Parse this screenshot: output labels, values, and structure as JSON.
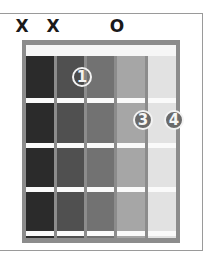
{
  "chord_diagram": {
    "string_markers": [
      {
        "string": 1,
        "label": "X",
        "x": 22
      },
      {
        "string": 2,
        "label": "X",
        "x": 53
      },
      {
        "string": 4,
        "label": "O",
        "x": 117
      }
    ],
    "columns": [
      {
        "x": 26,
        "w": 28,
        "color": "#2b2b2b"
      },
      {
        "x": 57,
        "w": 27,
        "color": "#505050"
      },
      {
        "x": 87,
        "w": 27,
        "color": "#727272"
      },
      {
        "x": 117,
        "w": 28,
        "color": "#a6a6a6"
      },
      {
        "x": 148,
        "w": 28,
        "color": "#e2e2e2"
      }
    ],
    "frets_y": [
      98,
      143,
      187,
      231
    ],
    "fingers": [
      {
        "label": "1",
        "string": 3,
        "fret": 1,
        "cx": 82,
        "cy": 77,
        "style": "open"
      },
      {
        "label": "3",
        "string": 5,
        "fret": 2,
        "cx": 143,
        "cy": 120,
        "style": "solid"
      },
      {
        "label": "4",
        "string": 6,
        "fret": 2,
        "cx": 174,
        "cy": 120,
        "style": "solid"
      }
    ],
    "colors": {
      "frame": "#8c8c8c",
      "nut": "#f6f6f6",
      "fret": "#fafafa",
      "marker_text": "#1a1a1a"
    }
  }
}
